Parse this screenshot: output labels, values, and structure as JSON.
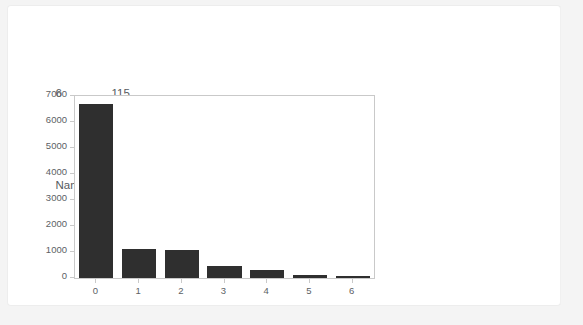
{
  "output": {
    "series_tail": {
      "rows": [
        {
          "index": "6",
          "value": "115"
        }
      ],
      "meta_name_key": "Name:",
      "meta_name_value": "index, dtype: int64"
    }
  },
  "chart_data": {
    "type": "bar",
    "title": "",
    "xlabel": "",
    "ylabel": "",
    "categories": [
      "0",
      "1",
      "2",
      "3",
      "4",
      "5",
      "6"
    ],
    "values": [
      6680,
      1120,
      1080,
      480,
      300,
      120,
      70
    ],
    "ylim": [
      0,
      7000
    ],
    "yticks": [
      0,
      1000,
      2000,
      3000,
      4000,
      5000,
      6000,
      7000
    ],
    "ytick_labels": [
      "0",
      "1000",
      "2000",
      "3000",
      "4000",
      "5000",
      "6000",
      "7000"
    ],
    "grid": false,
    "legend": false,
    "bar_color": "#2f2f2f",
    "axis_color": "#c9c9c9",
    "tick_label_color": "#5c6164"
  }
}
